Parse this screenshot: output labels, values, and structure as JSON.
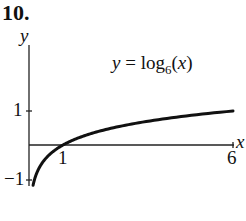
{
  "problem_number": "10.",
  "chart_data": {
    "type": "line",
    "title": "",
    "function_label": {
      "prefix": "y = log",
      "base": "6",
      "suffix": "(x)"
    },
    "xlabel": "x",
    "ylabel": "y",
    "x_ticks": [
      {
        "value": 1,
        "label": "1"
      },
      {
        "value": 6,
        "label": "6"
      }
    ],
    "y_ticks": [
      {
        "value": 1,
        "label": "1"
      },
      {
        "value": -1,
        "label": "−1"
      }
    ],
    "xlim": [
      0,
      6
    ],
    "ylim": [
      -1.2,
      1
    ],
    "series": [
      {
        "name": "y = log_6(x)",
        "x": [
          0.12,
          0.2,
          0.3,
          0.5,
          0.75,
          1,
          1.5,
          2,
          3,
          4,
          5,
          6
        ],
        "values": [
          -1.18,
          -0.9,
          -0.67,
          -0.39,
          -0.16,
          0,
          0.23,
          0.39,
          0.61,
          0.77,
          0.9,
          1
        ]
      }
    ],
    "grid": false,
    "legend": "none"
  }
}
